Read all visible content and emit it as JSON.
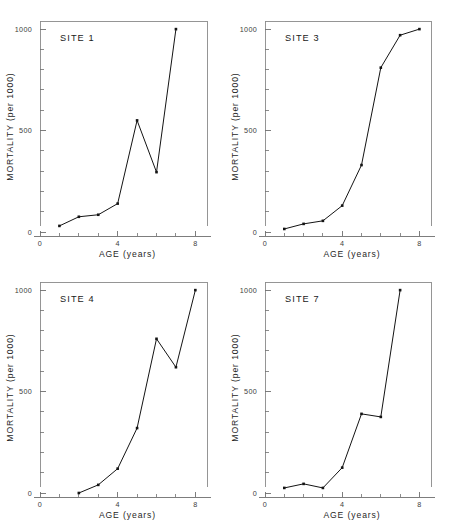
{
  "figure": {
    "panel_count": 4,
    "background_color": "#ffffff",
    "line_color": "#141414",
    "axis_color": "#6f6f6f"
  },
  "axes": {
    "xlabel": "AGE  (years)",
    "ylabel": "MORTALITY  (per 1000)",
    "x_tick_labels": [
      "0",
      "4",
      "8"
    ],
    "y_tick_labels": [
      "0",
      "500",
      "1000"
    ]
  },
  "panels": [
    {
      "label": "SITE 1"
    },
    {
      "label": "SITE 3"
    },
    {
      "label": "SITE 4"
    },
    {
      "label": "SITE 7"
    }
  ],
  "chart_data": [
    {
      "type": "line",
      "title": "SITE 1",
      "xlabel": "AGE  (years)",
      "ylabel": "MORTALITY  (per 1000)",
      "xlim": [
        0,
        8.6
      ],
      "ylim": [
        0,
        1040
      ],
      "xticks": [
        0,
        4,
        8
      ],
      "yticks": [
        0,
        500,
        1000
      ],
      "x_minor_step": 1,
      "y_minor_step": 100,
      "grid": false,
      "legend": "none",
      "markers": "filled-square",
      "x": [
        1,
        2,
        3,
        4,
        5,
        6,
        7
      ],
      "values": [
        30,
        75,
        85,
        140,
        550,
        295,
        1000
      ]
    },
    {
      "type": "line",
      "title": "SITE 3",
      "xlabel": "AGE  (years)",
      "ylabel": "MORTALITY  (per 1000)",
      "xlim": [
        0,
        8.6
      ],
      "ylim": [
        0,
        1040
      ],
      "xticks": [
        0,
        4,
        8
      ],
      "yticks": [
        0,
        500,
        1000
      ],
      "x_minor_step": 1,
      "y_minor_step": 100,
      "grid": false,
      "legend": "none",
      "markers": "filled-square",
      "x": [
        1,
        2,
        3,
        4,
        5,
        6,
        7,
        8
      ],
      "values": [
        15,
        40,
        55,
        130,
        330,
        810,
        970,
        1000
      ]
    },
    {
      "type": "line",
      "title": "SITE 4",
      "xlabel": "AGE  (years)",
      "ylabel": "MORTALITY  (per 1000)",
      "xlim": [
        0,
        8.6
      ],
      "ylim": [
        0,
        1040
      ],
      "xticks": [
        0,
        4,
        8
      ],
      "yticks": [
        0,
        500,
        1000
      ],
      "x_minor_step": 1,
      "y_minor_step": 100,
      "grid": false,
      "legend": "none",
      "markers": "filled-square",
      "x": [
        2,
        3,
        4,
        5,
        6,
        7,
        8
      ],
      "values": [
        0,
        40,
        120,
        320,
        760,
        620,
        1000
      ]
    },
    {
      "type": "line",
      "title": "SITE 7",
      "xlabel": "AGE  (years)",
      "ylabel": "MORTALITY  (per 1000)",
      "xlim": [
        0,
        8.6
      ],
      "ylim": [
        0,
        1040
      ],
      "xticks": [
        0,
        4,
        8
      ],
      "yticks": [
        0,
        500,
        1000
      ],
      "x_minor_step": 1,
      "y_minor_step": 100,
      "grid": false,
      "legend": "none",
      "markers": "filled-square",
      "x": [
        1,
        2,
        3,
        4,
        5,
        6,
        7
      ],
      "values": [
        25,
        45,
        25,
        125,
        390,
        375,
        1000
      ]
    }
  ]
}
